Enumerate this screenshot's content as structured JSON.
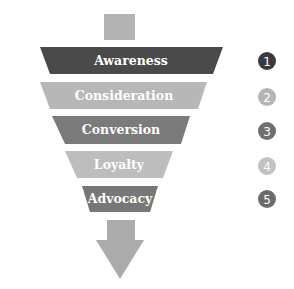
{
  "diagram": {
    "top_block_color": "#b3b3b3",
    "arrow_color": "#ababab",
    "stages": [
      {
        "label": "Awareness",
        "number": "1",
        "color": "#4a4a4a",
        "num_color": "#3a3a3a"
      },
      {
        "label": "Consideration",
        "number": "2",
        "color": "#b7b7b7",
        "num_color": "#b5b5b5"
      },
      {
        "label": "Conversion",
        "number": "3",
        "color": "#7b7b7b",
        "num_color": "#6f6f6f"
      },
      {
        "label": "Loyalty",
        "number": "4",
        "color": "#bdbdbd",
        "num_color": "#c2c2c2"
      },
      {
        "label": "Advocacy",
        "number": "5",
        "color": "#777777",
        "num_color": "#6b6b6b"
      }
    ]
  }
}
